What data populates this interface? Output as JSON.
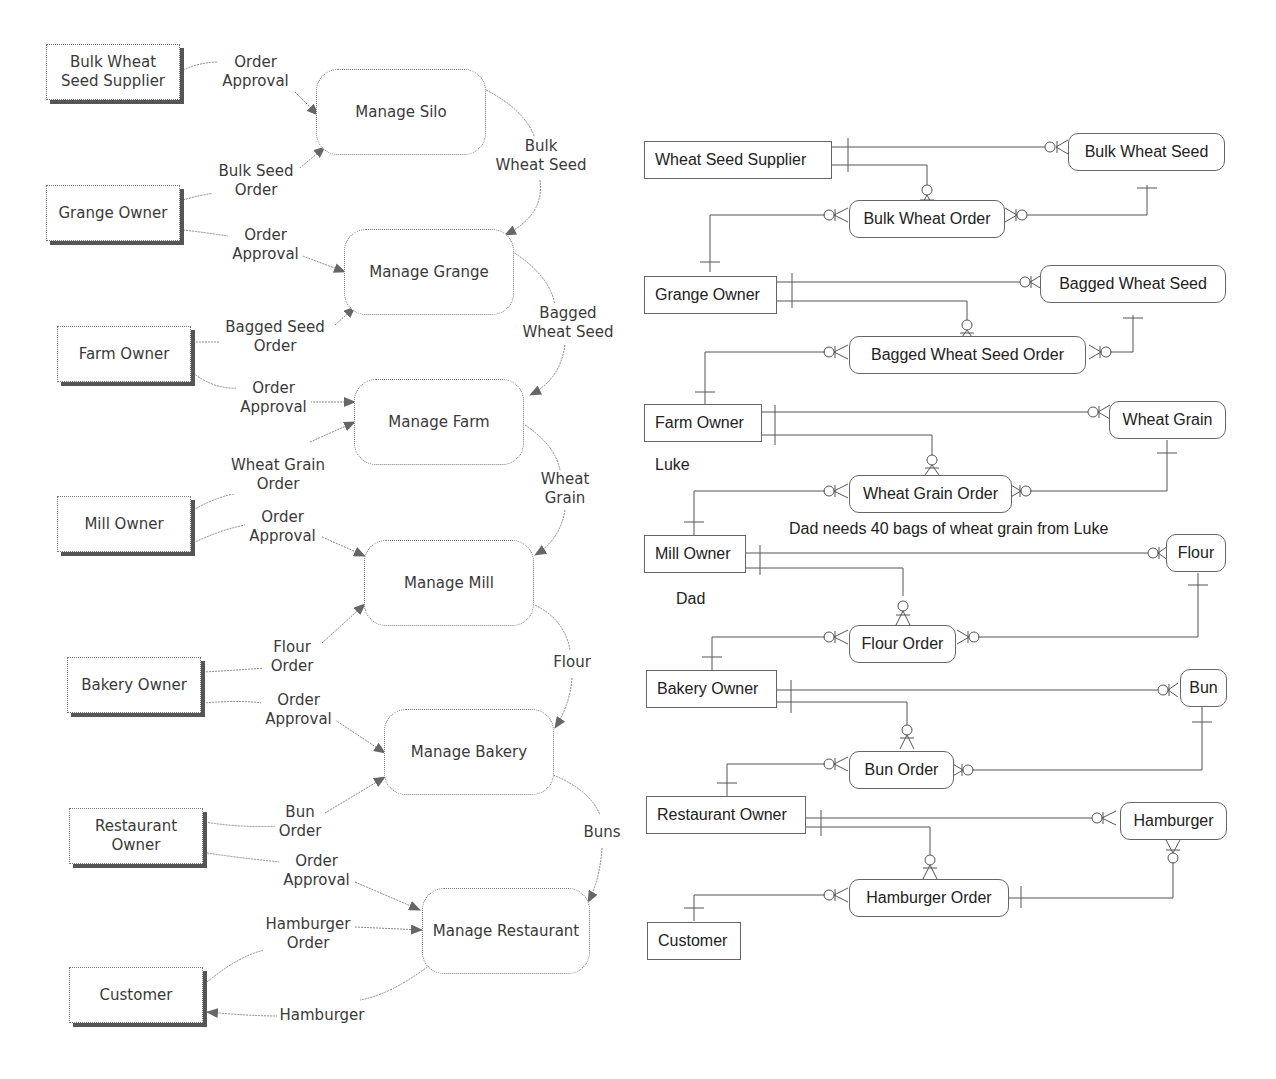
{
  "dfd": {
    "externals": [
      {
        "id": "bulk-wheat-seed-supplier",
        "label": "Bulk Wheat\nSeed Supplier"
      },
      {
        "id": "grange-owner",
        "label": "Grange Owner"
      },
      {
        "id": "farm-owner",
        "label": "Farm Owner"
      },
      {
        "id": "mill-owner",
        "label": "Mill Owner"
      },
      {
        "id": "bakery-owner",
        "label": "Bakery Owner"
      },
      {
        "id": "restaurant-owner",
        "label": "Restaurant\nOwner"
      },
      {
        "id": "customer",
        "label": "Customer"
      }
    ],
    "processes": [
      {
        "id": "manage-silo",
        "label": "Manage Silo"
      },
      {
        "id": "manage-grange",
        "label": "Manage Grange"
      },
      {
        "id": "manage-farm",
        "label": "Manage Farm"
      },
      {
        "id": "manage-mill",
        "label": "Manage Mill"
      },
      {
        "id": "manage-bakery",
        "label": "Manage Bakery"
      },
      {
        "id": "manage-restaurant",
        "label": "Manage Restaurant"
      }
    ],
    "flows": [
      {
        "label": "Order\nApproval",
        "from": "Bulk Wheat Seed Supplier",
        "to": "Manage Silo"
      },
      {
        "label": "Bulk Seed\nOrder",
        "from": "Grange Owner",
        "to": "Manage Silo"
      },
      {
        "label": "Bulk\nWheat Seed",
        "from": "Manage Silo",
        "to": "Manage Grange"
      },
      {
        "label": "Order\nApproval",
        "from": "Grange Owner",
        "to": "Manage Grange"
      },
      {
        "label": "Bagged Seed\nOrder",
        "from": "Farm Owner",
        "to": "Manage Grange"
      },
      {
        "label": "Bagged\nWheat Seed",
        "from": "Manage Grange",
        "to": "Manage Farm"
      },
      {
        "label": "Order\nApproval",
        "from": "Farm Owner",
        "to": "Manage Farm"
      },
      {
        "label": "Wheat Grain\nOrder",
        "from": "Mill Owner",
        "to": "Manage Farm"
      },
      {
        "label": "Wheat\nGrain",
        "from": "Manage Farm",
        "to": "Manage Mill"
      },
      {
        "label": "Order\nApproval",
        "from": "Mill Owner",
        "to": "Manage Mill"
      },
      {
        "label": "Flour\nOrder",
        "from": "Bakery Owner",
        "to": "Manage Mill"
      },
      {
        "label": "Flour",
        "from": "Manage Mill",
        "to": "Manage Bakery"
      },
      {
        "label": "Order\nApproval",
        "from": "Bakery Owner",
        "to": "Manage Bakery"
      },
      {
        "label": "Bun\nOrder",
        "from": "Restaurant Owner",
        "to": "Manage Bakery"
      },
      {
        "label": "Buns",
        "from": "Manage Bakery",
        "to": "Manage Restaurant"
      },
      {
        "label": "Order\nApproval",
        "from": "Restaurant Owner",
        "to": "Manage Restaurant"
      },
      {
        "label": "Hamburger\nOrder",
        "from": "Customer",
        "to": "Manage Restaurant"
      },
      {
        "label": "Hamburger",
        "from": "Manage Restaurant",
        "to": "Customer"
      }
    ]
  },
  "erd": {
    "owners": [
      {
        "id": "wheat-seed-supplier",
        "label": "Wheat Seed Supplier"
      },
      {
        "id": "grange-owner",
        "label": "Grange Owner"
      },
      {
        "id": "farm-owner",
        "label": "Farm Owner"
      },
      {
        "id": "mill-owner",
        "label": "Mill Owner"
      },
      {
        "id": "bakery-owner",
        "label": "Bakery Owner"
      },
      {
        "id": "restaurant-owner",
        "label": "Restaurant Owner"
      },
      {
        "id": "customer",
        "label": "Customer"
      }
    ],
    "products": [
      {
        "id": "bulk-wheat-seed",
        "label": "Bulk Wheat Seed"
      },
      {
        "id": "bagged-wheat-seed",
        "label": "Bagged Wheat Seed"
      },
      {
        "id": "wheat-grain",
        "label": "Wheat Grain"
      },
      {
        "id": "flour",
        "label": "Flour"
      },
      {
        "id": "bun",
        "label": "Bun"
      },
      {
        "id": "hamburger",
        "label": "Hamburger"
      }
    ],
    "orders": [
      {
        "id": "bulk-wheat-order",
        "label": "Bulk Wheat Order"
      },
      {
        "id": "bagged-wheat-seed-order",
        "label": "Bagged Wheat Seed Order"
      },
      {
        "id": "wheat-grain-order",
        "label": "Wheat Grain Order"
      },
      {
        "id": "flour-order",
        "label": "Flour Order"
      },
      {
        "id": "bun-order",
        "label": "Bun Order"
      },
      {
        "id": "hamburger-order",
        "label": "Hamburger Order"
      }
    ],
    "notes": {
      "luke": "Luke",
      "dad": "Dad",
      "requirement": "Dad needs 40 bags of wheat grain from Luke"
    }
  }
}
